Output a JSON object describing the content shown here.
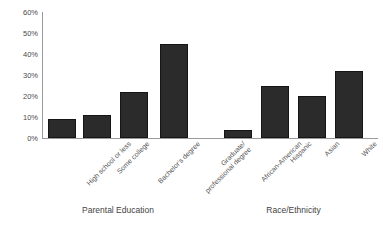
{
  "chart_data": {
    "type": "bar",
    "title": "",
    "xlabel": "",
    "ylabel": "",
    "ylim": [
      0,
      60
    ],
    "ytick_labels": [
      "60%",
      "50%",
      "40%",
      "30%",
      "20%",
      "10%",
      "0%"
    ],
    "ytick_values": [
      60,
      50,
      40,
      30,
      20,
      10,
      0
    ],
    "grid": false,
    "legend": "none",
    "groups": [
      {
        "name": "Parental Education",
        "categories": [
          "High school or less",
          "Some college",
          "Bachelor's degree",
          "Graduate/\nprofessional degree"
        ],
        "values": [
          9,
          11,
          22,
          45
        ]
      },
      {
        "name": "Race/Ethnicity",
        "categories": [
          "African-American",
          "Hispanic",
          "Asian",
          "White"
        ],
        "values": [
          4,
          25,
          20,
          32
        ]
      }
    ],
    "categories": [
      "High school or less",
      "Some college",
      "Bachelor's degree",
      "Graduate/professional degree",
      "African-American",
      "Hispanic",
      "Asian",
      "White"
    ],
    "values": [
      9,
      11,
      22,
      45,
      4,
      25,
      20,
      32
    ],
    "bar_color": "#2b2b2b"
  },
  "axis": {
    "y_labels": [
      "60%",
      "50%",
      "40%",
      "30%",
      "20%",
      "10%",
      "0%"
    ]
  },
  "groups": {
    "left_title": "Parental Education",
    "right_title": "Race/Ethnicity"
  },
  "cat_labels": {
    "c0_l1": "High school or less",
    "c1_l1": "Some college",
    "c2_l1": "Bachelor's degree",
    "c3_l1": "Graduate/",
    "c3_l2": "professional degree",
    "c4_l1": "African-American",
    "c5_l1": "Hispanic",
    "c6_l1": "Asian",
    "c7_l1": "White"
  }
}
